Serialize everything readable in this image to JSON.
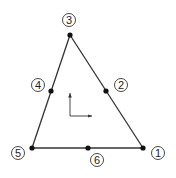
{
  "diagram": {
    "stroke_color": "#333333",
    "nodes": [
      {
        "id": "1",
        "label": "1",
        "x": 143,
        "y": 148,
        "lx": 158,
        "ly": 153
      },
      {
        "id": "2",
        "label": "2",
        "x": 106,
        "y": 91,
        "lx": 121,
        "ly": 85
      },
      {
        "id": "3",
        "label": "3",
        "x": 70,
        "y": 35,
        "lx": 69,
        "ly": 20
      },
      {
        "id": "4",
        "label": "4",
        "x": 51,
        "y": 91,
        "lx": 38,
        "ly": 85
      },
      {
        "id": "5",
        "label": "5",
        "x": 32,
        "y": 148,
        "lx": 18,
        "ly": 153
      },
      {
        "id": "6",
        "label": "6",
        "x": 88,
        "y": 148,
        "lx": 97,
        "ly": 160
      }
    ],
    "edges": [
      [
        "1",
        "3"
      ],
      [
        "3",
        "5"
      ],
      [
        "5",
        "1"
      ]
    ],
    "axes": {
      "origin": [
        70,
        116
      ],
      "x_end": [
        92,
        116
      ],
      "y_end": [
        70,
        93
      ]
    }
  }
}
